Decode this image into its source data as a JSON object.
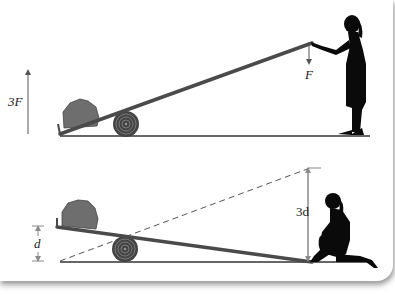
{
  "figure": {
    "top_panel": {
      "force_up_label": "3F",
      "force_down_label": "F"
    },
    "bottom_panel": {
      "small_displacement_label": "d",
      "large_displacement_label": "3d"
    }
  },
  "colors": {
    "lever": "#4a4a4a",
    "rock": "#6e6e6e",
    "log": "#555555",
    "silhouette": "#0a0a0a",
    "dimension": "#8a8a8a",
    "ground": "#333333"
  }
}
